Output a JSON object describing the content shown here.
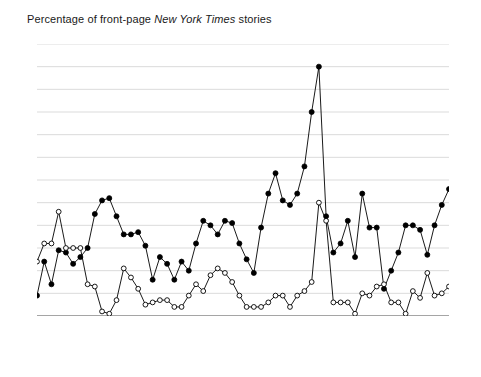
{
  "chart_data": {
    "type": "line",
    "title": "Percentage of front-page New York Times stories",
    "title_plain": "Percentage of front-page ",
    "title_italic": "New York Times",
    "title_tail": " stories",
    "xlabel": "",
    "ylabel": "",
    "ylim": [
      0,
      60
    ],
    "ytick_step": 5,
    "yticks": [
      "0",
      "5",
      "10",
      "15",
      "20",
      "25",
      "30",
      "35",
      "40",
      "45",
      "50",
      "55",
      "60"
    ],
    "xlim": [
      1948,
      2005
    ],
    "xticks": [
      "1948",
      "1952",
      "1956",
      "1960",
      "1964",
      "1968",
      "1972",
      "1976",
      "1980",
      "1984",
      "1988",
      "1992",
      "1996",
      "2000",
      "2005"
    ],
    "grid": "horizontal",
    "legend_position": "bottom-center",
    "x": [
      1948,
      1949,
      1950,
      1951,
      1952,
      1953,
      1954,
      1955,
      1956,
      1957,
      1958,
      1959,
      1960,
      1961,
      1962,
      1963,
      1964,
      1965,
      1966,
      1967,
      1968,
      1969,
      1970,
      1971,
      1972,
      1973,
      1974,
      1975,
      1976,
      1977,
      1978,
      1979,
      1980,
      1981,
      1982,
      1983,
      1984,
      1985,
      1986,
      1987,
      1988,
      1989,
      1990,
      1991,
      1992,
      1993,
      1994,
      1995,
      1996,
      1997,
      1998,
      1999,
      2000,
      2001,
      2002,
      2003,
      2004,
      2005
    ],
    "series": [
      {
        "name": "President",
        "marker": "filled-circle",
        "color": "#000000",
        "values": [
          4.5,
          12.0,
          7.0,
          14.5,
          14.0,
          11.5,
          13.0,
          15.0,
          22.5,
          25.5,
          26.0,
          22.0,
          18.0,
          18.0,
          18.5,
          15.5,
          8.0,
          13.0,
          11.5,
          8.0,
          12.0,
          10.0,
          16.0,
          21.0,
          20.0,
          18.0,
          21.0,
          20.5,
          16.0,
          12.5,
          9.5,
          19.5,
          27.0,
          31.5,
          25.5,
          24.5,
          27.0,
          33.0,
          45.0,
          55.0,
          22.0,
          14.0,
          16.0,
          21.0,
          13.0,
          27.0,
          19.5,
          19.5,
          6.0,
          10.0,
          14.0,
          20.0,
          20.0,
          19.0,
          13.5,
          20.0,
          24.5,
          28.0
        ]
      },
      {
        "name": "Congress",
        "marker": "open-circle",
        "color": "#000000",
        "values": [
          12.0,
          16.0,
          16.0,
          23.0,
          15.0,
          15.0,
          15.0,
          7.0,
          6.5,
          1.0,
          0.5,
          3.5,
          10.5,
          8.5,
          6.0,
          2.5,
          3.0,
          3.5,
          3.5,
          2.0,
          2.0,
          4.5,
          7.0,
          5.5,
          9.0,
          10.5,
          9.5,
          7.5,
          4.5,
          2.0,
          2.0,
          2.0,
          3.0,
          4.5,
          4.5,
          2.0,
          4.5,
          5.5,
          7.5,
          25.0,
          21.0,
          3.0,
          3.0,
          3.0,
          0.5,
          5.0,
          4.5,
          6.5,
          7.0,
          3.0,
          3.0,
          0.5,
          5.5,
          4.0,
          9.5,
          4.5,
          5.0,
          6.5
        ]
      }
    ]
  },
  "legend": {
    "items": [
      {
        "label": "President",
        "marker": "filled-circle"
      },
      {
        "label": "Congress",
        "marker": "open-circle"
      }
    ]
  }
}
